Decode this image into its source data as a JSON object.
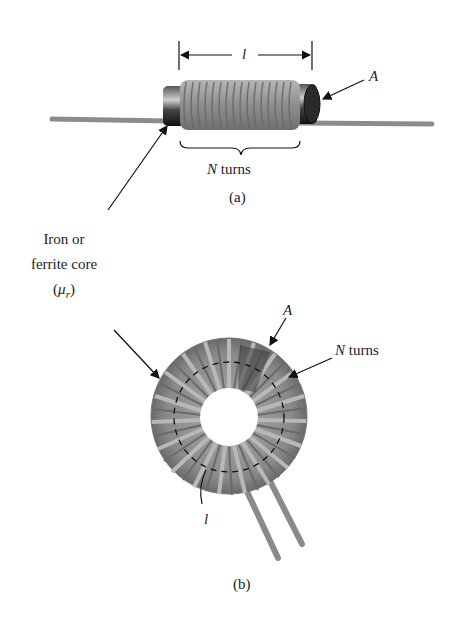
{
  "figure_a": {
    "length_label": "l",
    "area_label": "A",
    "turns_label_var": "N",
    "turns_label_text": " turns",
    "caption": "(a)"
  },
  "core_label": {
    "line1": "Iron or",
    "line2": "ferrite core",
    "mu_open": "(",
    "mu_symbol": "μ",
    "mu_sub": "r",
    "mu_close": ")"
  },
  "figure_b": {
    "area_label": "A",
    "turns_label_var": "N",
    "turns_label_text": " turns",
    "length_label": "l",
    "caption": "(b)"
  },
  "colors": {
    "coil": "#9a9a9a",
    "coil_dark": "#6e6e6e",
    "core": "#3a3a3a",
    "lead": "#8c8c8c",
    "text": "#222222"
  }
}
